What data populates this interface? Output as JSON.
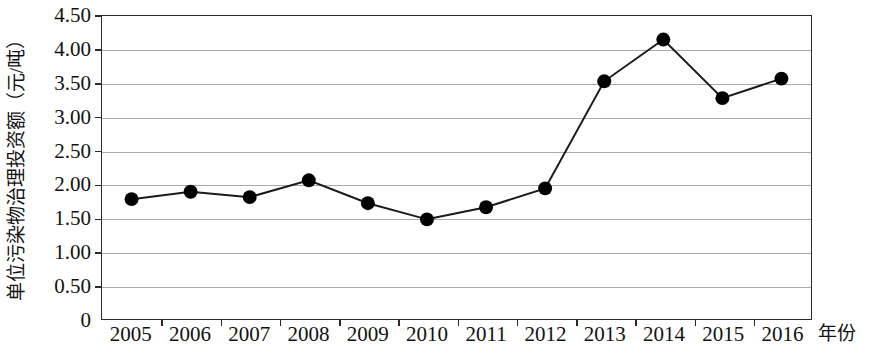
{
  "chart_data": {
    "type": "line",
    "title": "",
    "subtitle": "",
    "xlabel": "年份",
    "ylabel": "单位污染物治理投资额（元/吨）",
    "categories": [
      "2005",
      "2006",
      "2007",
      "2008",
      "2009",
      "2010",
      "2011",
      "2012",
      "2013",
      "2014",
      "2015",
      "2016"
    ],
    "values": [
      1.78,
      1.89,
      1.81,
      2.06,
      1.72,
      1.48,
      1.66,
      1.94,
      3.53,
      4.15,
      3.28,
      3.57
    ],
    "series": [
      {
        "name": "单位污染物治理投资额",
        "values": [
          1.78,
          1.89,
          1.81,
          2.06,
          1.72,
          1.48,
          1.66,
          1.94,
          3.53,
          4.15,
          3.28,
          3.57
        ]
      }
    ],
    "ylim": [
      0,
      4.5
    ],
    "ytick_labels": [
      "0",
      "0.50",
      "1.00",
      "1.50",
      "2.00",
      "2.50",
      "3.00",
      "3.50",
      "4.00",
      "4.50"
    ],
    "ytick_values": [
      0,
      0.5,
      1.0,
      1.5,
      2.0,
      2.5,
      3.0,
      3.5,
      4.0,
      4.5
    ],
    "grid": true,
    "grid_axis": "y",
    "legend": false,
    "legend_position": "none",
    "marker": "filled-circle",
    "marker_color": "#000000",
    "line_color": "#1a1a1a",
    "grid_color": "#aaaaaa",
    "axis_color": "#2b2b2b",
    "annotations": []
  },
  "axes": {
    "y_title": "单位污染物治理投资额（元/吨）",
    "x_title": "年份"
  }
}
